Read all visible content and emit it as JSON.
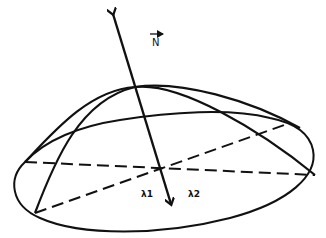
{
  "diagram": {
    "labels": {
      "normal_vector": "N",
      "lambda1": "λ1",
      "lambda2": "λ2"
    },
    "colors": {
      "stroke": "#111111",
      "background": "#ffffff"
    }
  }
}
